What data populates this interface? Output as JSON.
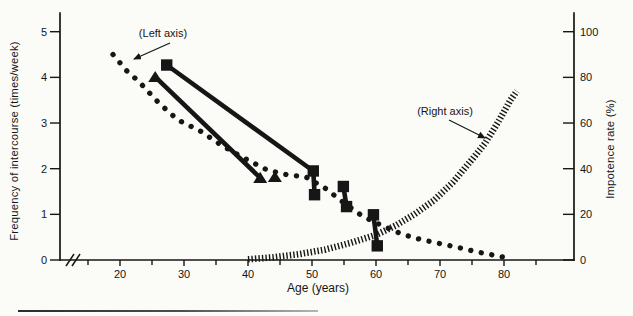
{
  "page": {
    "background": "#fbfbf8",
    "ink": "#161616"
  },
  "chart_data": {
    "type": "line",
    "title": "",
    "xlabel": "Age (years)",
    "ylabel_left": "Frequency of intercourse (times/week)",
    "ylabel_right": "Impotence rate (%)",
    "x_axis": {
      "major_ticks": [
        20,
        30,
        40,
        50,
        60,
        70,
        80
      ],
      "minor_ticks": [
        15,
        25,
        35,
        45,
        55,
        65,
        75,
        85
      ],
      "has_axis_break": true
    },
    "y_axis_left": {
      "ticks": [
        0,
        1,
        2,
        3,
        4,
        5
      ],
      "range": [
        0,
        5
      ]
    },
    "y_axis_right": {
      "ticks": [
        0,
        20,
        40,
        60,
        80,
        100
      ],
      "range": [
        0,
        100
      ]
    },
    "annotations": [
      {
        "id": "left-axis-callout",
        "label": "(Left axis)",
        "points_to": "intercourse-frequency-trend"
      },
      {
        "id": "right-axis-callout",
        "label": "(Right axis)",
        "points_to": "impotence-rate-curve"
      }
    ],
    "series": [
      {
        "name": "intercourse-frequency-trend",
        "axis": "left",
        "style": "dotted",
        "marker": "none",
        "points": [
          [
            18.9,
            4.5
          ],
          [
            21,
            4.15
          ],
          [
            23,
            3.9
          ],
          [
            26,
            3.45
          ],
          [
            29,
            3.07
          ],
          [
            32.5,
            2.83
          ],
          [
            36,
            2.5
          ],
          [
            39,
            2.26
          ],
          [
            43,
            1.97
          ],
          [
            46,
            1.87
          ],
          [
            49,
            1.82
          ],
          [
            52,
            1.58
          ],
          [
            55,
            1.25
          ],
          [
            58,
            0.95
          ],
          [
            61,
            0.75
          ],
          [
            64,
            0.57
          ],
          [
            67,
            0.45
          ],
          [
            70,
            0.36
          ],
          [
            73,
            0.27
          ],
          [
            76,
            0.17
          ],
          [
            79,
            0.09
          ],
          [
            81,
            0.03
          ]
        ]
      },
      {
        "name": "cohort-study-squares",
        "axis": "left",
        "style": "solid",
        "marker": "square",
        "segments": [
          [
            [
              27.3,
              4.27
            ],
            [
              50.2,
              1.95
            ],
            [
              50.4,
              1.43
            ]
          ],
          [
            [
              54.9,
              1.61
            ],
            [
              55.4,
              1.17
            ]
          ],
          [
            [
              59.6,
              0.99
            ],
            [
              60.2,
              0.31
            ]
          ]
        ]
      },
      {
        "name": "cohort-study-triangles",
        "axis": "left",
        "style": "solid",
        "marker": "triangle",
        "segments": [
          [
            [
              25.5,
              4.01
            ],
            [
              41.9,
              1.8
            ]
          ],
          [
            [
              44.2,
              1.82
            ]
          ]
        ]
      },
      {
        "name": "impotence-rate-curve",
        "axis": "right",
        "style": "hatched",
        "marker": "none",
        "points": [
          [
            40,
            0.3
          ],
          [
            44,
            1.2
          ],
          [
            48,
            2.6
          ],
          [
            52,
            4.5
          ],
          [
            56,
            7.5
          ],
          [
            60,
            11
          ],
          [
            63,
            15
          ],
          [
            66,
            20
          ],
          [
            69,
            26
          ],
          [
            72,
            34
          ],
          [
            75,
            44
          ],
          [
            77,
            51
          ],
          [
            79,
            60
          ],
          [
            81,
            70
          ],
          [
            82,
            74
          ]
        ]
      }
    ]
  }
}
